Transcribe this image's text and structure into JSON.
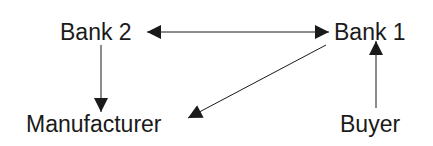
{
  "diagram": {
    "nodes": [
      {
        "id": "bank2",
        "label": "Bank 2"
      },
      {
        "id": "bank1",
        "label": "Bank 1"
      },
      {
        "id": "manufacturer",
        "label": "Manufacturer"
      },
      {
        "id": "buyer",
        "label": "Buyer"
      }
    ],
    "edges": [
      {
        "from": "bank2",
        "to": "bank1",
        "bidirectional": true
      },
      {
        "from": "bank2",
        "to": "manufacturer",
        "bidirectional": false
      },
      {
        "from": "bank1",
        "to": "manufacturer",
        "bidirectional": false
      },
      {
        "from": "buyer",
        "to": "bank1",
        "bidirectional": false
      }
    ],
    "colors": {
      "line": "#1a1a1a",
      "background": "#ffffff"
    }
  }
}
